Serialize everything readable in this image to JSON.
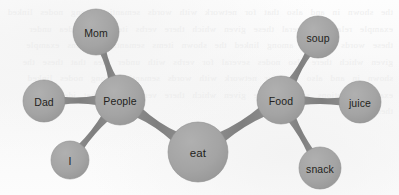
{
  "diagram": {
    "type": "node-link-graph",
    "width": 399,
    "height": 195,
    "style": {
      "background_color": "#fbfbfb",
      "node_fill": "#a5a5a5",
      "node_fill_dark": "#9a9a9a",
      "node_stroke": "#8e8e8e",
      "edge_color": "#8a8a8a",
      "label_color": "#231f20"
    },
    "nodes": [
      {
        "id": "mom",
        "label": "Mom",
        "cx": 96,
        "cy": 32,
        "r": 23,
        "font_size": 10.5
      },
      {
        "id": "dad",
        "label": "Dad",
        "cx": 44,
        "cy": 101,
        "r": 21,
        "font_size": 10.5
      },
      {
        "id": "i",
        "label": "I",
        "cx": 70,
        "cy": 160,
        "r": 19,
        "font_size": 10.5
      },
      {
        "id": "people",
        "label": "People",
        "cx": 120,
        "cy": 100,
        "r": 25,
        "font_size": 10.5
      },
      {
        "id": "eat",
        "label": "eat",
        "cx": 198,
        "cy": 152,
        "r": 30,
        "font_size": 11.5
      },
      {
        "id": "food",
        "label": "Food",
        "cx": 281,
        "cy": 100,
        "r": 24,
        "font_size": 10.5
      },
      {
        "id": "soup",
        "label": "soup",
        "cx": 318,
        "cy": 37,
        "r": 21,
        "font_size": 10.5
      },
      {
        "id": "juice",
        "label": "juice",
        "cx": 360,
        "cy": 102,
        "r": 21,
        "font_size": 10.5
      },
      {
        "id": "snack",
        "label": "snack",
        "cx": 320,
        "cy": 168,
        "r": 21,
        "font_size": 10.5
      }
    ],
    "edges": [
      {
        "id": "edge-people-mom",
        "source": "people",
        "target": "mom",
        "width_source": 9,
        "width_target": 7,
        "waist": 3.0
      },
      {
        "id": "edge-people-dad",
        "source": "people",
        "target": "dad",
        "width_source": 10,
        "width_target": 8,
        "waist": 3.4
      },
      {
        "id": "edge-people-i",
        "source": "people",
        "target": "i",
        "width_source": 9,
        "width_target": 7,
        "waist": 2.8
      },
      {
        "id": "edge-people-eat",
        "source": "people",
        "target": "eat",
        "width_source": 11,
        "width_target": 11,
        "waist": 3.6
      },
      {
        "id": "edge-eat-food",
        "source": "eat",
        "target": "food",
        "width_source": 11,
        "width_target": 11,
        "waist": 3.6
      },
      {
        "id": "edge-food-soup",
        "source": "food",
        "target": "soup",
        "width_source": 9,
        "width_target": 7,
        "waist": 3.0
      },
      {
        "id": "edge-food-juice",
        "source": "food",
        "target": "juice",
        "width_source": 9,
        "width_target": 8,
        "waist": 3.2
      },
      {
        "id": "edge-food-snack",
        "source": "food",
        "target": "snack",
        "width_source": 9,
        "width_target": 7,
        "waist": 3.0
      }
    ]
  },
  "background": {
    "ghost_text": "the shown in and also that for network with words semantic among nodes linked example relations several these given which there verbs items that idea under these words network among linked the shown items semantic relations example given which there also nodes several for verbs with under idea that these the shown in and also that for network with words semantic among nodes linked example relations several these given which there verbs items that idea under these words"
  }
}
